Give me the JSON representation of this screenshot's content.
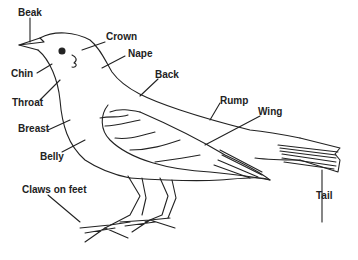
{
  "diagram": {
    "line_color": "#222222",
    "background": "#ffffff",
    "labels": [
      {
        "id": "beak",
        "text": "Beak"
      },
      {
        "id": "crown",
        "text": "Crown"
      },
      {
        "id": "nape",
        "text": "Nape"
      },
      {
        "id": "chin",
        "text": "Chin"
      },
      {
        "id": "back",
        "text": "Back"
      },
      {
        "id": "throat",
        "text": "Throat"
      },
      {
        "id": "rump",
        "text": "Rump"
      },
      {
        "id": "wing",
        "text": "Wing"
      },
      {
        "id": "breast",
        "text": "Breast"
      },
      {
        "id": "belly",
        "text": "Belly"
      },
      {
        "id": "claws",
        "text": "Claws on feet"
      },
      {
        "id": "tail",
        "text": "Tail"
      }
    ]
  }
}
